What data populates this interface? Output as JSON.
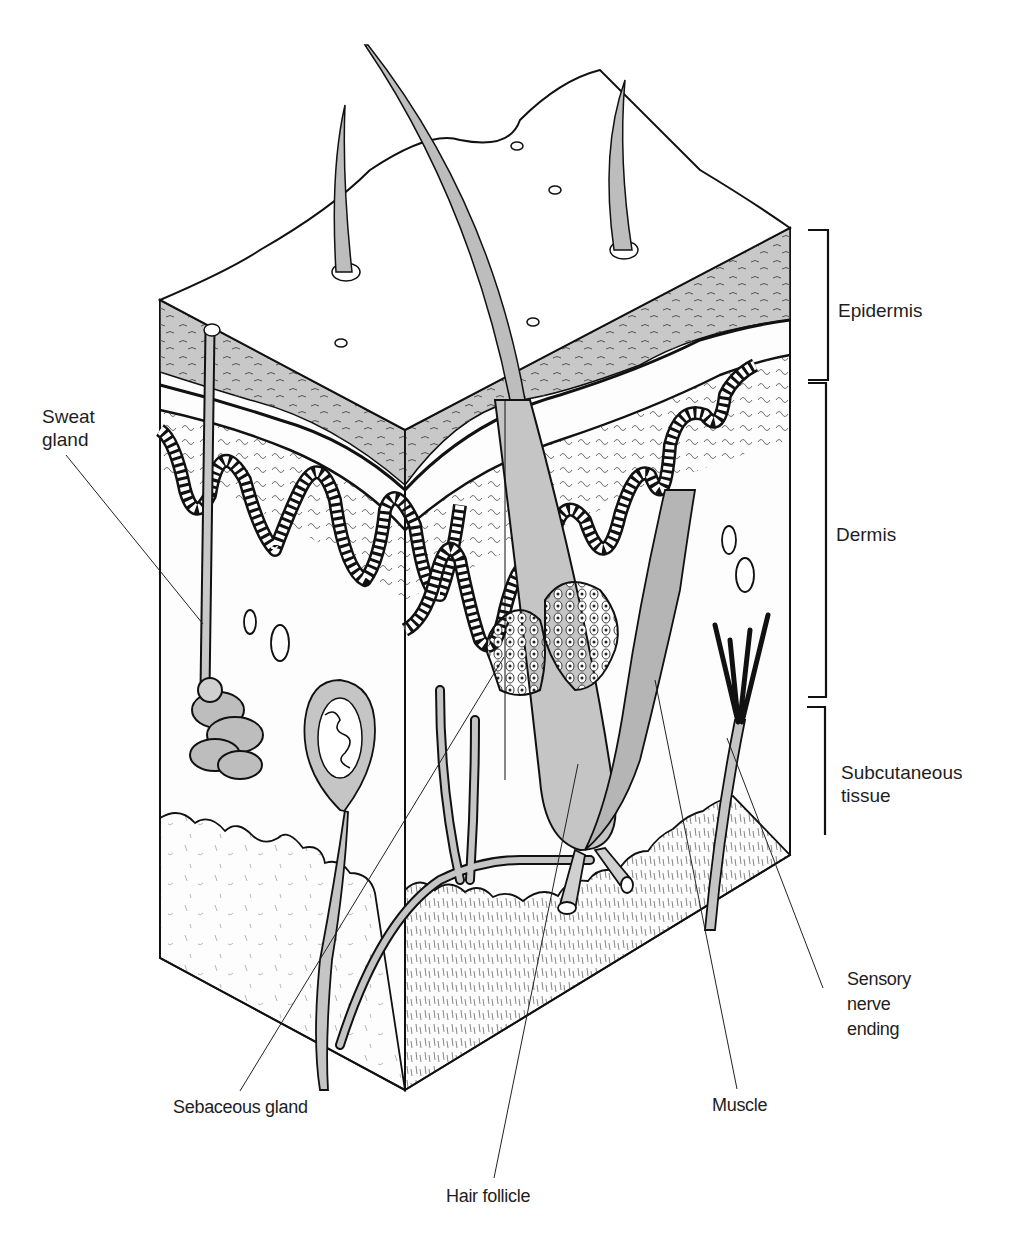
{
  "diagram": {
    "colors": {
      "background": "#ffffff",
      "outline": "#111111",
      "shade": "#bdbdbd",
      "light_shade": "#d9d9d9",
      "paper": "#fbfbfb"
    },
    "layer_brackets": [
      {
        "id": "epidermis",
        "label": "Epidermis",
        "top": 230,
        "bottom": 380
      },
      {
        "id": "dermis",
        "label": "Dermis",
        "top": 383,
        "bottom": 697
      },
      {
        "id": "subcutaneous",
        "label": "Subcutaneous\ntissue",
        "top": 707,
        "bottom": 835
      }
    ],
    "callouts": [
      {
        "id": "sweat-gland",
        "label": "Sweat\ngland"
      },
      {
        "id": "sebaceous-gland",
        "label": "Sebaceous gland"
      },
      {
        "id": "hair-follicle",
        "label": "Hair follicle"
      },
      {
        "id": "muscle",
        "label": "Muscle"
      },
      {
        "id": "sensory-nerve-ending",
        "label": "Sensory\nnerve\nending"
      }
    ]
  }
}
